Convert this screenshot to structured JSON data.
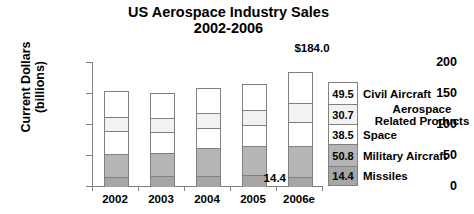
{
  "chart_data": {
    "type": "bar",
    "subtype": "stacked-bar",
    "title": "US Aerospace Industry Sales",
    "subtitle": "2002-2006",
    "xlabel": "",
    "ylabel": "Current Dollars\n(billions)",
    "ylabel_line1": "Current Dollars",
    "ylabel_line2": "(billions)",
    "ylim": [
      0,
      200
    ],
    "yticks": [
      0,
      50,
      100,
      150,
      200
    ],
    "ytick_labels": [
      "0",
      "50",
      "100",
      "150",
      "200"
    ],
    "categories": [
      "2002",
      "2003",
      "2004",
      "2005",
      "2006e"
    ],
    "grid": false,
    "legend_position": "right-stacked-column",
    "series": [
      {
        "name": "Missiles",
        "color": "#a6a6a6",
        "values": [
          15.0,
          15.5,
          16.5,
          17.0,
          14.4
        ]
      },
      {
        "name": "Military Aircraft",
        "color": "#b5b5b5",
        "values": [
          36.0,
          38.0,
          44.0,
          48.0,
          50.8
        ]
      },
      {
        "name": "Space",
        "color": "#ffffff",
        "values": [
          37.0,
          33.0,
          33.0,
          33.0,
          38.5
        ]
      },
      {
        "name": "Aerospace\nRelated Products",
        "color": "#f2f2f2",
        "values": [
          24.0,
          23.0,
          24.0,
          25.0,
          30.7
        ]
      },
      {
        "name": "Civil Aircraft",
        "color": "#ffffff",
        "values": [
          42.0,
          40.5,
          40.5,
          41.0,
          49.5
        ]
      }
    ],
    "totals": [
      154.0,
      150.0,
      158.0,
      164.0,
      184.0
    ],
    "annotations": [
      {
        "name": "total-2006e",
        "text": "$184.0"
      },
      {
        "name": "missiles-2006e",
        "text": "14.4"
      }
    ],
    "legend_items": [
      {
        "value": "49.5",
        "label": "Civil Aircraft",
        "color": "#ffffff",
        "centered": false
      },
      {
        "value": "30.7",
        "label": "Aerospace\nRelated Products",
        "color": "#f2f2f2",
        "centered": true
      },
      {
        "value": "38.5",
        "label": "Space",
        "color": "#ffffff",
        "centered": false
      },
      {
        "value": "50.8",
        "label": "Military Aircraft",
        "color": "#b5b5b5",
        "centered": false
      },
      {
        "value": "14.4",
        "label": "Missiles",
        "color": "#a6a6a6",
        "centered": false
      }
    ]
  }
}
